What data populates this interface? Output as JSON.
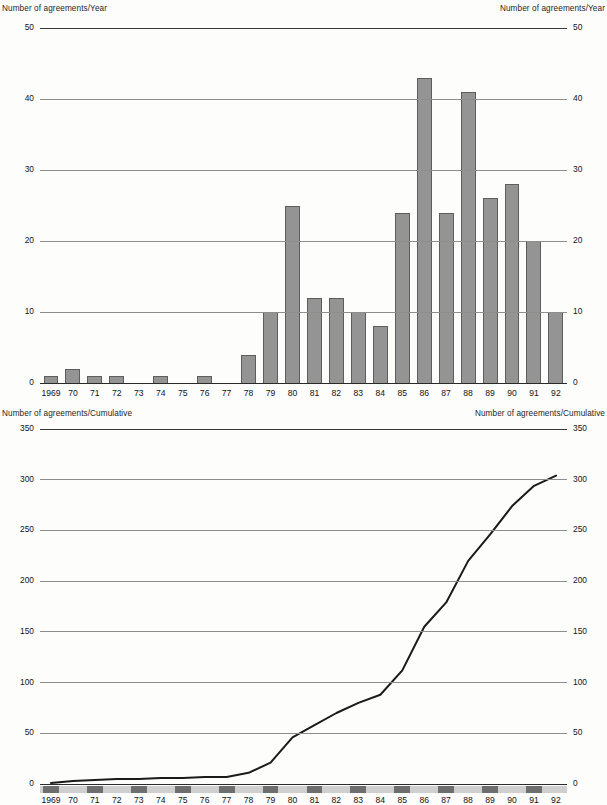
{
  "chart_data": [
    {
      "type": "bar",
      "title": "Number of agreements/Year",
      "title_right": "Number of agreements/Year",
      "xlabel": "",
      "ylabel": "Number of agreements/Year",
      "ylim": [
        0,
        50
      ],
      "yticks": [
        0,
        10,
        20,
        30,
        40,
        50
      ],
      "grid": true,
      "legend": "none",
      "categories": [
        "1969",
        "70",
        "71",
        "72",
        "73",
        "74",
        "75",
        "76",
        "77",
        "78",
        "79",
        "80",
        "81",
        "82",
        "83",
        "84",
        "85",
        "86",
        "87",
        "88",
        "89",
        "90",
        "91",
        "92"
      ],
      "values": [
        1,
        2,
        1,
        1,
        0,
        1,
        0,
        1,
        0,
        4,
        10,
        25,
        12,
        12,
        10,
        8,
        24,
        43,
        24,
        41,
        26,
        28,
        20,
        10
      ],
      "bar_color": "#949494",
      "bar_edge_color": "#5d5d5d"
    },
    {
      "type": "line",
      "title": "Number of agreements/Cumulative",
      "title_right": "Number of agreements/Cumulative",
      "xlabel": "",
      "ylabel": "Number of agreements/Cumulative",
      "ylim": [
        0,
        350
      ],
      "yticks": [
        0,
        50,
        100,
        150,
        200,
        250,
        300,
        350
      ],
      "grid": true,
      "legend": "none",
      "categories": [
        "1969",
        "70",
        "71",
        "72",
        "73",
        "74",
        "75",
        "76",
        "77",
        "78",
        "79",
        "80",
        "81",
        "82",
        "83",
        "84",
        "85",
        "86",
        "87",
        "88",
        "89",
        "90",
        "91",
        "92"
      ],
      "values": [
        1,
        3,
        4,
        5,
        5,
        6,
        6,
        7,
        7,
        11,
        21,
        46,
        58,
        70,
        80,
        88,
        112,
        155,
        179,
        220,
        246,
        274,
        294,
        304
      ],
      "line_color": "#1a1a1a"
    }
  ],
  "top_chart": {
    "title_left": "Number of agreements/Year",
    "title_right": "Number of agreements/Year",
    "yticks_left": [
      "50",
      "40",
      "30",
      "20",
      "10",
      "0"
    ],
    "yticks_right": [
      "50",
      "40",
      "30",
      "20",
      "10",
      "0"
    ],
    "xlabels": [
      "1969",
      "70",
      "71",
      "72",
      "73",
      "74",
      "75",
      "76",
      "77",
      "78",
      "79",
      "80",
      "81",
      "82",
      "83",
      "84",
      "85",
      "86",
      "87",
      "88",
      "89",
      "90",
      "91",
      "92"
    ]
  },
  "bottom_chart": {
    "title_left": "Number of agreements/Cumulative",
    "title_right": "Number of agreements/Cumulative",
    "yticks_left": [
      "350",
      "300",
      "250",
      "200",
      "150",
      "100",
      "50",
      "0"
    ],
    "yticks_right": [
      "350",
      "300",
      "250",
      "200",
      "150",
      "100",
      "50",
      "0"
    ],
    "xlabels": [
      "1969",
      "70",
      "71",
      "72",
      "73",
      "74",
      "75",
      "76",
      "77",
      "78",
      "79",
      "80",
      "81",
      "82",
      "83",
      "84",
      "85",
      "86",
      "87",
      "88",
      "89",
      "90",
      "91",
      "92"
    ]
  }
}
